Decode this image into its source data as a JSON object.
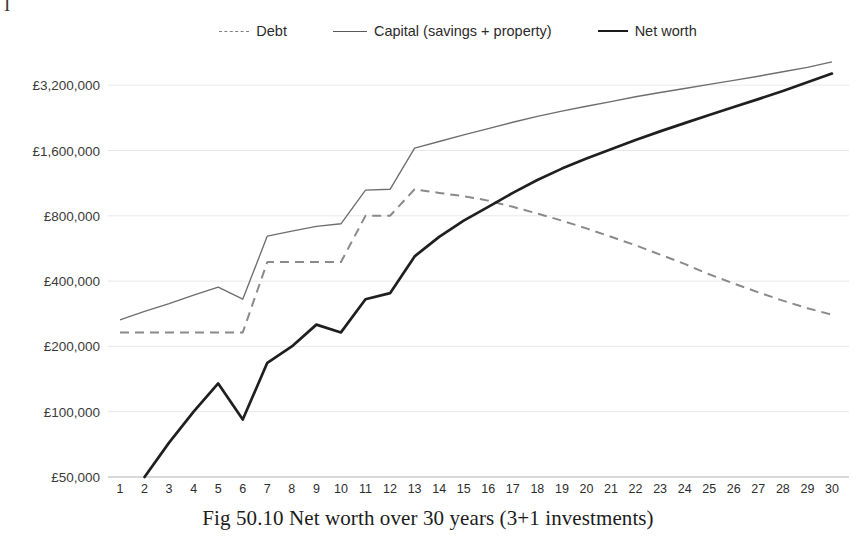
{
  "page": {
    "top_scrap_glyph": "I",
    "caption": "Fig 50.10 Net worth over 30 years (3+1 investments)"
  },
  "legend": {
    "position": "top-center",
    "items": [
      {
        "label": "Debt",
        "style": "dashed",
        "color": "#8a8a8a"
      },
      {
        "label": "Capital (savings + property)",
        "style": "solid-thin",
        "color": "#6e6e6e"
      },
      {
        "label": "Net worth",
        "style": "solid-thick",
        "color": "#1f1f1f"
      }
    ]
  },
  "chart_data": {
    "type": "line",
    "title": "Fig 50.10 Net worth over 30 years (3+1 investments)",
    "xlabel": "",
    "ylabel": "",
    "yscale": "log2",
    "ylim": [
      50000,
      4400000
    ],
    "grid": true,
    "ytick_labels": [
      "£3,200,000",
      "£1,600,000",
      "£800,000",
      "£400,000",
      "£200,000",
      "£100,000",
      "£50,000"
    ],
    "ytick_values": [
      3200000,
      1600000,
      800000,
      400000,
      200000,
      100000,
      50000
    ],
    "x": [
      1,
      2,
      3,
      4,
      5,
      6,
      7,
      8,
      9,
      10,
      11,
      12,
      13,
      14,
      15,
      16,
      17,
      18,
      19,
      20,
      21,
      22,
      23,
      24,
      25,
      26,
      27,
      28,
      29,
      30
    ],
    "xtick_labels": [
      "1",
      "2",
      "3",
      "4",
      "5",
      "6",
      "7",
      "8",
      "9",
      "10",
      "11",
      "12",
      "13",
      "14",
      "15",
      "16",
      "17",
      "18",
      "19",
      "20",
      "21",
      "22",
      "23",
      "24",
      "25",
      "26",
      "27",
      "28",
      "29",
      "30"
    ],
    "series": [
      {
        "name": "Debt",
        "style": "dashed",
        "color": "#8a8a8a",
        "values": [
          232000,
          232000,
          232000,
          232000,
          232000,
          232000,
          490000,
          490000,
          490000,
          490000,
          800000,
          800000,
          1060000,
          1020000,
          985000,
          940000,
          880000,
          820000,
          760000,
          700000,
          640000,
          585000,
          530000,
          480000,
          430000,
          390000,
          355000,
          325000,
          300000,
          280000
        ]
      },
      {
        "name": "Capital (savings + property)",
        "style": "solid-thin",
        "color": "#6e6e6e",
        "values": [
          265000,
          290000,
          315000,
          345000,
          375000,
          330000,
          645000,
          680000,
          715000,
          735000,
          1050000,
          1060000,
          1640000,
          1760000,
          1890000,
          2020000,
          2160000,
          2300000,
          2430000,
          2560000,
          2690000,
          2830000,
          2960000,
          3090000,
          3230000,
          3370000,
          3520000,
          3690000,
          3870000,
          4100000
        ]
      },
      {
        "name": "Net worth",
        "style": "solid-thick",
        "color": "#1f1f1f",
        "values": [
          null,
          50000,
          72000,
          100000,
          135000,
          92000,
          168000,
          200000,
          252000,
          232000,
          330000,
          352000,
          520000,
          640000,
          760000,
          880000,
          1020000,
          1170000,
          1320000,
          1470000,
          1620000,
          1790000,
          1960000,
          2140000,
          2330000,
          2540000,
          2760000,
          3010000,
          3300000,
          3620000
        ]
      }
    ]
  }
}
